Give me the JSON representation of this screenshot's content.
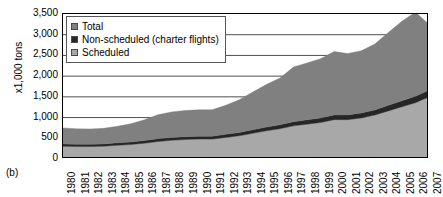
{
  "panel_label": "(b)",
  "legend": {
    "position": "top-left-inside",
    "items": [
      {
        "label": "Total",
        "color": "#808080",
        "icon": "square-swatch"
      },
      {
        "label": "Non-scheduled (charter flights)",
        "color": "#262626",
        "icon": "square-swatch"
      },
      {
        "label": "Scheduled",
        "color": "#a8a8a8",
        "icon": "square-swatch"
      }
    ]
  },
  "chart_data": {
    "type": "area",
    "title": "",
    "subtitle": "",
    "xlabel": "",
    "ylabel": "x1,000 tons",
    "ylim": [
      0,
      3500
    ],
    "ytick_labels": [
      "3,500",
      "3,000",
      "2,500",
      "2,000",
      "1,500",
      "1,000",
      "500",
      "0"
    ],
    "ytick_values": [
      3500,
      3000,
      2500,
      2000,
      1500,
      1000,
      500,
      0
    ],
    "grid": "horizontal",
    "stacked": true,
    "categories": [
      "1980",
      "1981",
      "1982",
      "1983",
      "1984",
      "1985",
      "1986",
      "1987",
      "1988",
      "1989",
      "1990",
      "1991",
      "1992",
      "1993",
      "1994",
      "1995",
      "1996",
      "1997",
      "1998",
      "1999",
      "2000",
      "2001",
      "2002",
      "2003",
      "2004",
      "2005",
      "2006",
      "2007"
    ],
    "series": [
      {
        "name": "Scheduled",
        "color": "#a8a8a8",
        "values": [
          310,
          300,
          300,
          310,
          330,
          350,
          380,
          420,
          450,
          470,
          480,
          480,
          520,
          560,
          620,
          680,
          730,
          800,
          840,
          880,
          950,
          950,
          990,
          1060,
          1160,
          1260,
          1360,
          1500
        ]
      },
      {
        "name": "Non-scheduled (charter flights)",
        "color": "#262626",
        "values": [
          55,
          55,
          55,
          55,
          60,
          60,
          65,
          70,
          70,
          70,
          70,
          70,
          75,
          80,
          85,
          90,
          95,
          100,
          105,
          110,
          115,
          115,
          120,
          125,
          135,
          145,
          155,
          165
        ]
      },
      {
        "name": "Total",
        "color": "#808080",
        "values": [
          385,
          375,
          370,
          375,
          400,
          440,
          500,
          580,
          615,
          630,
          640,
          640,
          700,
          790,
          910,
          1030,
          1130,
          1320,
          1375,
          1430,
          1530,
          1480,
          1500,
          1590,
          1760,
          1920,
          2030,
          1585
        ]
      }
    ],
    "totals": [
      750,
      730,
      725,
      740,
      790,
      850,
      945,
      1070,
      1135,
      1170,
      1190,
      1190,
      1295,
      1430,
      1615,
      1800,
      1955,
      2220,
      2320,
      2420,
      2595,
      2545,
      2610,
      2775,
      3055,
      3325,
      3545,
      3250
    ]
  }
}
